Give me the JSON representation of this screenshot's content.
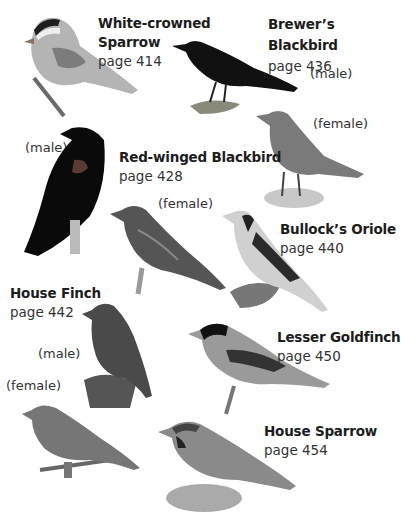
{
  "entries": [
    {
      "name_lines": [
        "White-crowned",
        "Sparrow"
      ],
      "page": "page 414"
    },
    {
      "name_lines": [
        "Brewer’s",
        "Blackbird"
      ],
      "page": "page 436",
      "sexes": [
        "(male)",
        "(female)"
      ]
    },
    {
      "name_lines": [
        "Red-winged Blackbird"
      ],
      "page": "page 428",
      "sexes": [
        "(male)",
        "(female)"
      ]
    },
    {
      "name_lines": [
        "Bullock’s Oriole"
      ],
      "page": "page 440"
    },
    {
      "name_lines": [
        "House Finch"
      ],
      "page": "page 442",
      "sexes": [
        "(male)",
        "(female)"
      ]
    },
    {
      "name_lines": [
        "Lesser Goldfinch"
      ],
      "page": "page 450"
    },
    {
      "name_lines": [
        "House Sparrow"
      ],
      "page": "page 454"
    }
  ]
}
